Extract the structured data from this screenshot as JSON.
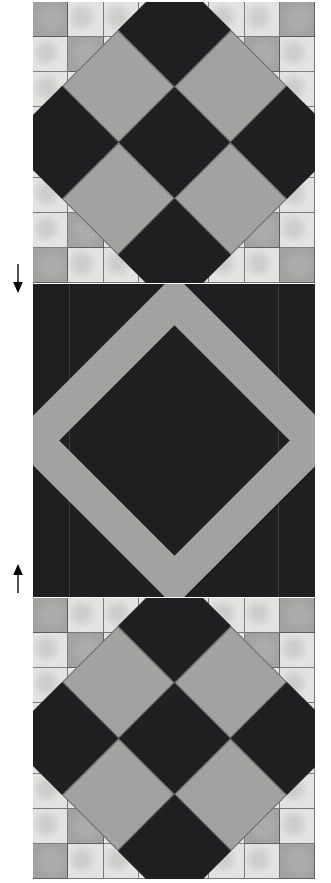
{
  "figure": {
    "width": 331,
    "height": 883,
    "background": "#ffffff"
  },
  "colors": {
    "light_fabric": "#e3e3e1",
    "gray_fabric": "#a3a3a1",
    "dark_fabric": "#1f1f21",
    "seam_line": "#2d2d2d",
    "arrow": "#000000"
  },
  "blocks": [
    {
      "id": "block-top",
      "name": "top-block",
      "type": "checkerboard-with-rotated-nine-patch",
      "grid": {
        "rows": 8,
        "cols": 8
      },
      "checker_pattern": [
        [
          "gray",
          "light",
          "light",
          "light",
          "light",
          "light",
          "light",
          "gray"
        ],
        [
          "light",
          "gray",
          "light",
          "light",
          "light",
          "light",
          "gray",
          "light"
        ],
        [
          "light",
          "light",
          "gray",
          "light",
          "light",
          "gray",
          "light",
          "light"
        ],
        [
          "light",
          "light",
          "light",
          "gray",
          "gray",
          "light",
          "light",
          "light"
        ],
        [
          "light",
          "light",
          "light",
          "gray",
          "gray",
          "light",
          "light",
          "light"
        ],
        [
          "light",
          "light",
          "gray",
          "light",
          "light",
          "gray",
          "light",
          "light"
        ],
        [
          "light",
          "gray",
          "light",
          "light",
          "light",
          "light",
          "gray",
          "light"
        ],
        [
          "gray",
          "light",
          "light",
          "light",
          "light",
          "light",
          "light",
          "gray"
        ]
      ],
      "nine_patch": [
        [
          "dark",
          "gray",
          "dark"
        ],
        [
          "gray",
          "dark",
          "gray"
        ],
        [
          "dark",
          "gray",
          "dark"
        ]
      ]
    },
    {
      "id": "block-middle",
      "name": "middle-block",
      "type": "dark-field-with-gray-diamond-band",
      "field": "dark",
      "band": "gray",
      "band_width_px": 36,
      "seams": [
        36,
        245
      ]
    },
    {
      "id": "block-bottom",
      "name": "bottom-block",
      "type": "checkerboard-with-rotated-nine-patch",
      "grid": {
        "rows": 8,
        "cols": 8
      },
      "checker_pattern": [
        [
          "gray",
          "light",
          "light",
          "light",
          "light",
          "light",
          "light",
          "gray"
        ],
        [
          "light",
          "gray",
          "light",
          "light",
          "light",
          "light",
          "gray",
          "light"
        ],
        [
          "light",
          "light",
          "gray",
          "light",
          "light",
          "gray",
          "light",
          "light"
        ],
        [
          "light",
          "light",
          "light",
          "gray",
          "gray",
          "light",
          "light",
          "light"
        ],
        [
          "light",
          "light",
          "light",
          "gray",
          "gray",
          "light",
          "light",
          "light"
        ],
        [
          "light",
          "light",
          "gray",
          "light",
          "light",
          "gray",
          "light",
          "light"
        ],
        [
          "light",
          "gray",
          "light",
          "light",
          "light",
          "light",
          "gray",
          "light"
        ],
        [
          "gray",
          "light",
          "light",
          "light",
          "light",
          "light",
          "light",
          "gray"
        ]
      ],
      "nine_patch": [
        [
          "dark",
          "gray",
          "dark"
        ],
        [
          "gray",
          "dark",
          "gray"
        ],
        [
          "dark",
          "gray",
          "dark"
        ]
      ]
    }
  ],
  "annotations": [
    {
      "id": "arrow-down",
      "name": "down-arrow-marker",
      "direction": "down",
      "x": 10,
      "y": 264
    },
    {
      "id": "arrow-up",
      "name": "up-arrow-marker",
      "direction": "up",
      "x": 10,
      "y": 563
    }
  ]
}
